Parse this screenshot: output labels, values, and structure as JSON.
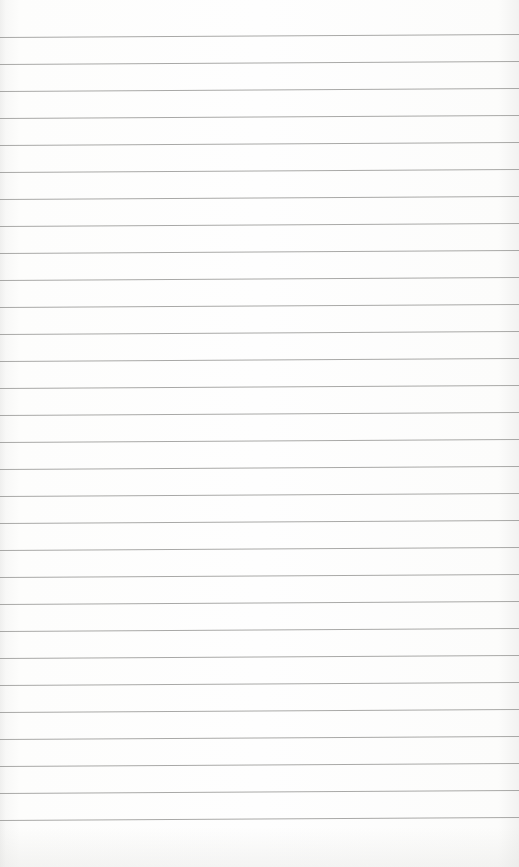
{
  "document": {
    "type": "lined-notebook-page",
    "content_text": "",
    "ruling": {
      "line_count": 30,
      "first_line_y_left": 37,
      "first_line_y_right": 34,
      "spacing_px": 27,
      "line_color": "#9a9a98",
      "paper_color": "#fbfbfa"
    }
  }
}
